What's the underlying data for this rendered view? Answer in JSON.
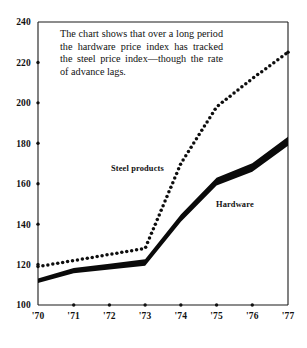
{
  "annotation": {
    "text": "The chart shows that over a long period the hardware price index has tracked the steel price index—though the rate of advance lags."
  },
  "chart_data": {
    "type": "line",
    "title": "",
    "subtitle": "",
    "xlabel": "",
    "ylabel": "",
    "x": [
      "'70",
      "'71",
      "'72",
      "'73",
      "'74",
      "'75",
      "'76",
      "'77"
    ],
    "categories": [
      "'70",
      "'71",
      "'72",
      "'73",
      "'74",
      "'75",
      "'76",
      "'77"
    ],
    "xlim": [
      1970,
      1977
    ],
    "ylim": [
      100,
      240
    ],
    "ytick_values": [
      100,
      120,
      140,
      160,
      180,
      200,
      220,
      240
    ],
    "ytick_labels": [
      "100",
      "120",
      "140",
      "160",
      "180",
      "200",
      "220",
      "240"
    ],
    "xtick_labels": [
      "'70",
      "'71",
      "'72",
      "'73",
      "'74",
      "'75",
      "'76",
      "'77"
    ],
    "grid": false,
    "legend_position": "inline-annotations",
    "series": [
      {
        "name": "Steel products",
        "style": "dotted",
        "color": "#0d0d0d",
        "values": [
          119,
          122,
          125,
          128,
          170,
          198,
          212,
          225
        ]
      },
      {
        "name": "Hardware",
        "style": "thick-band",
        "color": "#0a0a0a",
        "values": [
          112,
          117,
          119,
          121,
          143,
          161,
          168,
          181
        ]
      }
    ],
    "annotations": [
      {
        "name": "steel-products-label",
        "text": "Steel products"
      },
      {
        "name": "hardware-label",
        "text": "Hardware"
      }
    ]
  },
  "labels": {
    "steel": "Steel products",
    "hardware": "Hardware"
  }
}
